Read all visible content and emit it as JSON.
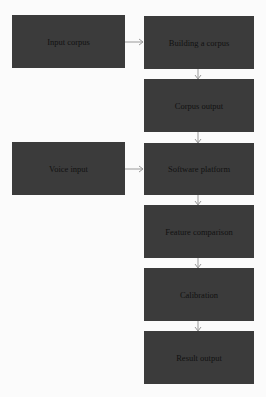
{
  "nodes": {
    "input_corpus": "Input corpus",
    "building": "Building a corpus",
    "corpus_output": "Corpus output",
    "voice_input": "Voice input",
    "software": "Software platform",
    "feature": "Feature comparison",
    "calibration": "Calibration",
    "result": "Result output"
  },
  "colors": {
    "box": "#3b3b3b",
    "arrow": "#999999",
    "background": "#fbfbfb"
  }
}
